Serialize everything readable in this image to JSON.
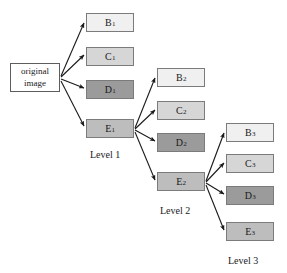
{
  "diagram": {
    "background_color": "#ffffff",
    "arrow_color": "#1a1a1a",
    "border_color": "#7b7b7b",
    "text_color": "#1a1a1a",
    "root": {
      "line1": "original",
      "line2": "image",
      "fill": "#ffffff",
      "x": 10,
      "y": 63,
      "w": 50,
      "h": 29
    },
    "levels": [
      {
        "label": "Level 1",
        "label_x": 90,
        "label_y": 149,
        "nodes": [
          {
            "letter": "B",
            "subscript": "1",
            "fill": "#f0f0f0",
            "x": 86,
            "y": 13,
            "w": 48,
            "h": 19
          },
          {
            "letter": "C",
            "subscript": "1",
            "fill": "#d6d6d6",
            "x": 86,
            "y": 47,
            "w": 48,
            "h": 19
          },
          {
            "letter": "D",
            "subscript": "1",
            "fill": "#9b9b9b",
            "x": 86,
            "y": 80,
            "w": 48,
            "h": 19
          },
          {
            "letter": "E",
            "subscript": "1",
            "fill": "#bdbdbd",
            "x": 86,
            "y": 119,
            "w": 48,
            "h": 19
          }
        ]
      },
      {
        "label": "Level 2",
        "label_x": 160,
        "label_y": 205,
        "nodes": [
          {
            "letter": "B",
            "subscript": "2",
            "fill": "#f0f0f0",
            "x": 157,
            "y": 68,
            "w": 48,
            "h": 19
          },
          {
            "letter": "C",
            "subscript": "2",
            "fill": "#d6d6d6",
            "x": 157,
            "y": 101,
            "w": 48,
            "h": 19
          },
          {
            "letter": "D",
            "subscript": "2",
            "fill": "#9b9b9b",
            "x": 157,
            "y": 133,
            "w": 48,
            "h": 19
          },
          {
            "letter": "E",
            "subscript": "2",
            "fill": "#bdbdbd",
            "x": 157,
            "y": 172,
            "w": 48,
            "h": 19
          }
        ]
      },
      {
        "label": "Level 3",
        "label_x": 228,
        "label_y": 255,
        "nodes": [
          {
            "letter": "B",
            "subscript": "3",
            "fill": "#f0f0f0",
            "x": 226,
            "y": 123,
            "w": 48,
            "h": 19
          },
          {
            "letter": "C",
            "subscript": "3",
            "fill": "#d6d6d6",
            "x": 226,
            "y": 154,
            "w": 48,
            "h": 19
          },
          {
            "letter": "D",
            "subscript": "3",
            "fill": "#9b9b9b",
            "x": 226,
            "y": 186,
            "w": 48,
            "h": 19
          },
          {
            "letter": "E",
            "subscript": "3",
            "fill": "#bdbdbd",
            "x": 226,
            "y": 222,
            "w": 48,
            "h": 19
          }
        ]
      }
    ],
    "edges": [
      {
        "from": "original-image",
        "to": "B1",
        "x1": 61,
        "y1": 76,
        "x2": 84,
        "y2": 23
      },
      {
        "from": "original-image",
        "to": "C1",
        "x1": 61,
        "y1": 77,
        "x2": 84,
        "y2": 55
      },
      {
        "from": "original-image",
        "to": "D1",
        "x1": 61,
        "y1": 79,
        "x2": 84,
        "y2": 88
      },
      {
        "from": "original-image",
        "to": "E1",
        "x1": 61,
        "y1": 81,
        "x2": 84,
        "y2": 126
      },
      {
        "from": "E1",
        "to": "B2",
        "x1": 135,
        "y1": 128,
        "x2": 155,
        "y2": 78
      },
      {
        "from": "E1",
        "to": "C2",
        "x1": 135,
        "y1": 129,
        "x2": 155,
        "y2": 110
      },
      {
        "from": "E1",
        "to": "D2",
        "x1": 135,
        "y1": 130,
        "x2": 155,
        "y2": 141
      },
      {
        "from": "E1",
        "to": "E2",
        "x1": 135,
        "y1": 132,
        "x2": 155,
        "y2": 180
      },
      {
        "from": "E2",
        "to": "B3",
        "x1": 206,
        "y1": 181,
        "x2": 224,
        "y2": 133
      },
      {
        "from": "E2",
        "to": "C3",
        "x1": 206,
        "y1": 182,
        "x2": 224,
        "y2": 163
      },
      {
        "from": "E2",
        "to": "D3",
        "x1": 206,
        "y1": 183,
        "x2": 224,
        "y2": 194
      },
      {
        "from": "E2",
        "to": "E3",
        "x1": 206,
        "y1": 185,
        "x2": 224,
        "y2": 230
      }
    ]
  }
}
